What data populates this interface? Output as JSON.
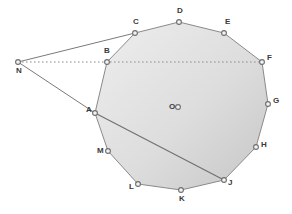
{
  "figure": {
    "background_color": "#ffffff",
    "stroke_color": "#808080",
    "fill_color_light": "#eeeeee",
    "fill_color_dark": "#c9c9c9",
    "label_color": "#3a3a3a",
    "marker_fill": "#f2f2f2",
    "marker_stroke": "#6e6e6e",
    "width": 292,
    "height": 214
  },
  "points": [
    {
      "name": "A",
      "label": "A",
      "x": 95,
      "y": 113,
      "label_dx": -9,
      "label_dy": -3,
      "type": "polygon-vertex"
    },
    {
      "name": "B",
      "label": "B",
      "x": 107,
      "y": 62,
      "label_dx": -3,
      "label_dy": -11,
      "type": "polygon-vertex"
    },
    {
      "name": "C",
      "label": "C",
      "x": 135,
      "y": 33,
      "label_dx": -2,
      "label_dy": -11,
      "type": "polygon-vertex"
    },
    {
      "name": "D",
      "label": "D",
      "x": 179,
      "y": 22,
      "label_dx": -2,
      "label_dy": -11,
      "type": "polygon-vertex"
    },
    {
      "name": "E",
      "label": "E",
      "x": 224,
      "y": 33,
      "label_dx": 1,
      "label_dy": -11,
      "type": "polygon-vertex"
    },
    {
      "name": "F",
      "label": "F",
      "x": 262,
      "y": 62,
      "label_dx": 5,
      "label_dy": -4,
      "type": "polygon-vertex"
    },
    {
      "name": "G",
      "label": "G",
      "x": 268,
      "y": 104,
      "label_dx": 5,
      "label_dy": -3,
      "type": "polygon-vertex"
    },
    {
      "name": "H",
      "label": "H",
      "x": 256,
      "y": 147,
      "label_dx": 5,
      "label_dy": -2,
      "type": "polygon-vertex"
    },
    {
      "name": "J",
      "label": "J",
      "x": 224,
      "y": 180,
      "label_dx": 4,
      "label_dy": 3,
      "type": "polygon-vertex"
    },
    {
      "name": "K",
      "label": "K",
      "x": 181,
      "y": 190,
      "label_dx": -2,
      "label_dy": 9,
      "type": "polygon-vertex"
    },
    {
      "name": "L",
      "label": "L",
      "x": 138,
      "y": 184,
      "label_dx": -9,
      "label_dy": 3,
      "type": "polygon-vertex"
    },
    {
      "name": "M",
      "label": "M",
      "x": 108,
      "y": 151,
      "label_dx": -11,
      "label_dy": 0,
      "type": "polygon-vertex"
    },
    {
      "name": "O",
      "label": "",
      "x": 178,
      "y": 107,
      "label_dx": 0,
      "label_dy": 0,
      "type": "center"
    },
    {
      "name": "N",
      "label": "N",
      "x": 18,
      "y": 62,
      "label_dx": -2,
      "label_dy": 9,
      "type": "external-point"
    }
  ],
  "polygon": {
    "name": "dodecagon-ABCDEFGHJKLM",
    "vertex_order": [
      "A",
      "B",
      "C",
      "D",
      "E",
      "F",
      "G",
      "H",
      "J",
      "K",
      "L",
      "M"
    ],
    "sides": 12
  },
  "segments": [
    {
      "name": "segment-NC",
      "from": "N",
      "to": "C",
      "style": "solid"
    },
    {
      "name": "segment-NA",
      "from": "N",
      "to": "A",
      "style": "solid"
    },
    {
      "name": "segment-AJ",
      "from": "A",
      "to": "J",
      "style": "solid"
    },
    {
      "name": "segment-NF",
      "from": "N",
      "to": "F",
      "style": "dotted"
    }
  ],
  "labels": {
    "center_label": "O",
    "external_label": "N"
  }
}
